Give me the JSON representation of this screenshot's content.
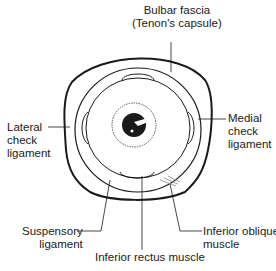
{
  "diagram": {
    "labels": {
      "bulbar_fascia_line1": "Bulbar fascia",
      "bulbar_fascia_line2": "(Tenon's capsule)",
      "medial_line1": "Medial",
      "medial_line2": "check",
      "medial_line3": "ligament",
      "lateral_line1": "Lateral",
      "lateral_line2": "check",
      "lateral_line3": "ligament",
      "suspensory_line1": "Suspensory",
      "suspensory_line2": "ligament",
      "inferior_oblique_line1": "Inferior oblique",
      "inferior_oblique_line2": "muscle",
      "inferior_rectus": "Inferior rectus muscle"
    },
    "colors": {
      "ink": "#1a1a1a",
      "background": "#ffffff"
    }
  }
}
